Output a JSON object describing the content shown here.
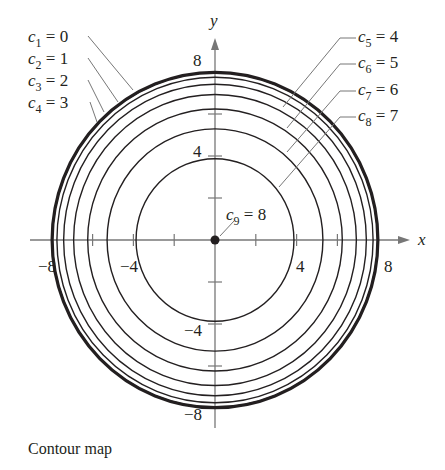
{
  "caption": "Contour map",
  "chart_data": {
    "type": "contour",
    "title": "Contour map",
    "function_hint": "f(x,y) = sqrt(64 - x^2 - y^2)",
    "xlabel": "x",
    "ylabel": "y",
    "xlim": [
      -8,
      8
    ],
    "ylim": [
      -8,
      8
    ],
    "x_tick_labels": [
      "-8",
      "-4",
      "4",
      "8"
    ],
    "y_tick_labels": [
      "8",
      "4",
      "-4",
      "-8"
    ],
    "x_ticks": [
      -8,
      -6,
      -4,
      -2,
      2,
      4,
      6,
      8
    ],
    "y_ticks": [
      -8,
      -6,
      -4,
      -2,
      2,
      4,
      6,
      8
    ],
    "contours": [
      {
        "name": "c1",
        "index": "1",
        "value": 0,
        "radius": 8.0
      },
      {
        "name": "c2",
        "index": "2",
        "value": 1,
        "radius": 7.94
      },
      {
        "name": "c3",
        "index": "3",
        "value": 2,
        "radius": 7.75
      },
      {
        "name": "c4",
        "index": "4",
        "value": 3,
        "radius": 7.42
      },
      {
        "name": "c5",
        "index": "5",
        "value": 4,
        "radius": 6.93
      },
      {
        "name": "c6",
        "index": "6",
        "value": 5,
        "radius": 6.24
      },
      {
        "name": "c7",
        "index": "7",
        "value": 6,
        "radius": 5.29
      },
      {
        "name": "c8",
        "index": "8",
        "value": 7,
        "radius": 3.87
      },
      {
        "name": "c9",
        "index": "9",
        "value": 8,
        "radius": 0
      }
    ],
    "colors": {
      "ink": "#231f20",
      "axis": "#777777"
    }
  }
}
